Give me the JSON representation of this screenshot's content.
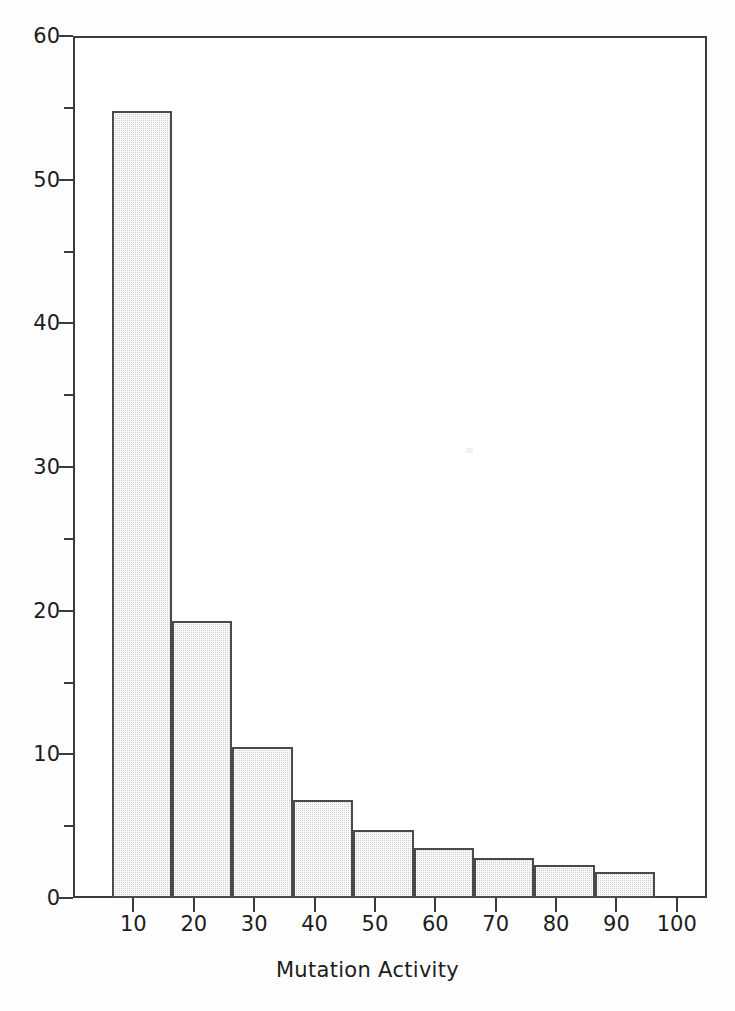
{
  "chart_data": {
    "type": "bar",
    "title": "",
    "subtitle": "",
    "xlabel": "Mutation Activity",
    "ylabel": "",
    "categories": [
      "10",
      "20",
      "30",
      "40",
      "50",
      "60",
      "70",
      "80",
      "90"
    ],
    "values": [
      54.8,
      19.3,
      10.5,
      6.8,
      4.7,
      3.5,
      2.8,
      2.3,
      1.8
    ],
    "x": [
      10,
      20,
      30,
      40,
      50,
      60,
      70,
      80,
      90
    ],
    "xlim": [
      0,
      105
    ],
    "ylim": [
      0,
      60
    ],
    "x_ticks": [
      10,
      20,
      30,
      40,
      50,
      60,
      70,
      80,
      90,
      100
    ],
    "x_tick_labels": [
      "10",
      "20",
      "30",
      "40",
      "50",
      "60",
      "70",
      "80",
      "90",
      "100"
    ],
    "y_ticks": [
      0,
      10,
      20,
      30,
      40,
      50,
      60
    ],
    "y_tick_labels": [
      "0",
      "10",
      "20",
      "30",
      "40",
      "50",
      "60"
    ],
    "y_minor_ticks": [
      5,
      15,
      25,
      35,
      45,
      55
    ],
    "grid": false,
    "legend": null,
    "legend_position": "none",
    "bar_fill_color": "#cfcfcf",
    "bar_edge_color": "#4a4a4a",
    "axis_color": "#3a3a3a",
    "background_color": "#ffffff",
    "bar_width_units": 10,
    "bar_pattern": "stipple"
  },
  "axes": {
    "x_title": "Mutation Activity",
    "y_title": ""
  }
}
